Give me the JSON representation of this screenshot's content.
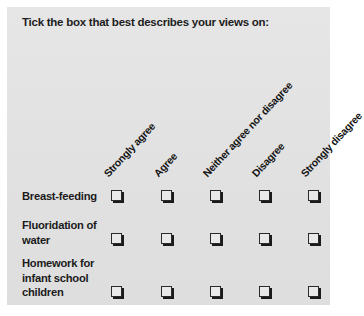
{
  "panel": {
    "background_color": "#e3e3e3",
    "text_color": "#1b1b1b"
  },
  "question": {
    "heading": "Tick the box that best describes your views on:"
  },
  "scale": {
    "options": [
      {
        "label": "Strongly agree"
      },
      {
        "label": "Agree"
      },
      {
        "label": "Neither agree nor disagree"
      },
      {
        "label": "Disagree"
      },
      {
        "label": "Strongly disagree"
      }
    ]
  },
  "rows": [
    {
      "label": "Breast-feeding"
    },
    {
      "label": "Fluoridation of water"
    },
    {
      "label": "Homework for infant school children"
    }
  ],
  "checkbox": {
    "state": "unchecked",
    "border_color": "#2a2a2a",
    "shadow_color": "#1a1a1a"
  }
}
